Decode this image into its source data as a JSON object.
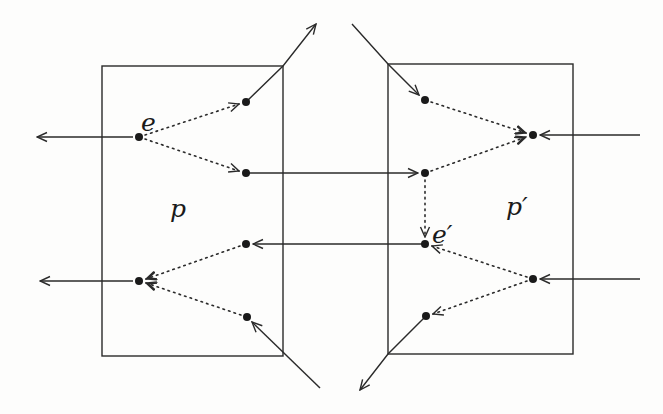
{
  "diagram": {
    "type": "process-event-flow",
    "labels": {
      "e": "e",
      "e_prime": "e′",
      "p": "p",
      "p_prime": "p′"
    },
    "boxes": [
      {
        "id": "p",
        "label": "p",
        "x": 102,
        "y": 66,
        "width": 181,
        "height": 290
      },
      {
        "id": "p_prime",
        "label": "p′",
        "x": 388,
        "y": 64,
        "width": 185,
        "height": 290
      }
    ],
    "nodes": [
      {
        "id": "e",
        "box": "p",
        "x": 139,
        "y": 137,
        "label": "e"
      },
      {
        "id": "pA",
        "box": "p",
        "x": 246,
        "y": 102
      },
      {
        "id": "pB",
        "box": "p",
        "x": 246,
        "y": 173
      },
      {
        "id": "pC",
        "box": "p",
        "x": 246,
        "y": 244
      },
      {
        "id": "pD",
        "box": "p",
        "x": 139,
        "y": 281
      },
      {
        "id": "pE",
        "box": "p",
        "x": 247,
        "y": 317
      },
      {
        "id": "qF",
        "box": "p_prime",
        "x": 425,
        "y": 100
      },
      {
        "id": "qG",
        "box": "p_prime",
        "x": 533,
        "y": 135
      },
      {
        "id": "qH",
        "box": "p_prime",
        "x": 425,
        "y": 173
      },
      {
        "id": "e_prime",
        "box": "p_prime",
        "x": 425,
        "y": 244,
        "label": "e′"
      },
      {
        "id": "qI",
        "box": "p_prime",
        "x": 533,
        "y": 279
      },
      {
        "id": "qJ",
        "box": "p_prime",
        "x": 426,
        "y": 316
      }
    ],
    "dotted_edges": [
      {
        "from": "e",
        "to": "pA"
      },
      {
        "from": "e",
        "to": "pB"
      },
      {
        "from": "pC",
        "to": "pD"
      },
      {
        "from": "pE",
        "to": "pD"
      },
      {
        "from": "qF",
        "to": "qG"
      },
      {
        "from": "qH",
        "to": "qG"
      },
      {
        "from": "qH",
        "to": "e_prime"
      },
      {
        "from": "qI",
        "to": "e_prime"
      },
      {
        "from": "qI",
        "to": "qJ"
      }
    ],
    "solid_edges": [
      {
        "from": "e",
        "to": "exit-left-top"
      },
      {
        "from": "pA",
        "to": "exit-top"
      },
      {
        "from": "pB",
        "to": "qH"
      },
      {
        "from": "e_prime",
        "to": "pC"
      },
      {
        "from": "pD",
        "to": "exit-left-bottom"
      },
      {
        "from": "entry-bottom-left",
        "to": "pE"
      },
      {
        "from": "entry-top-right",
        "to": "qF"
      },
      {
        "from": "entry-right-top",
        "to": "qG"
      },
      {
        "from": "entry-right-bottom",
        "to": "qI"
      },
      {
        "from": "qJ",
        "to": "exit-bottom"
      }
    ]
  }
}
